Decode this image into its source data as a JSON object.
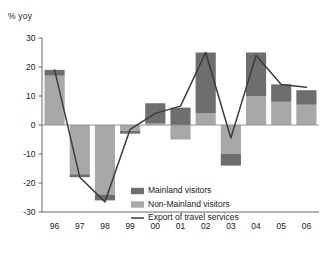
{
  "chart_data": {
    "type": "bar",
    "subtype": "stacked-bar-with-line-overlay",
    "title": "",
    "unit_label": "% yoy",
    "xlabel": "",
    "ylabel": "",
    "ylim": [
      -30,
      30
    ],
    "yticks": [
      30,
      20,
      10,
      0,
      -10,
      -20,
      -30
    ],
    "ytick_labels": [
      "30",
      "20",
      "10",
      "0",
      "-10",
      "-20",
      "-30"
    ],
    "grid": false,
    "legend_position": "inside-right-lower",
    "categories": [
      "96",
      "97",
      "98",
      "99",
      "00",
      "01",
      "02",
      "03",
      "04",
      "05",
      "06"
    ],
    "series": [
      {
        "name": "Mainland visitors",
        "type": "bar",
        "stack": "contrib",
        "color": "#6e6e6e",
        "values": [
          2,
          -1,
          -2,
          -1,
          7,
          6,
          21,
          -4,
          15,
          6,
          5
        ]
      },
      {
        "name": "Non-Mainland visitors",
        "type": "bar",
        "stack": "contrib",
        "color": "#a8a8a8",
        "values": [
          17,
          -17,
          -24,
          -2,
          0.5,
          -5,
          4,
          -10,
          10,
          8,
          7
        ]
      },
      {
        "name": "Export of travel services",
        "type": "line",
        "color": "#3c3c3c",
        "values": [
          19,
          -18,
          -26.5,
          -1.5,
          4,
          6.5,
          25,
          -4.5,
          24,
          14,
          13
        ]
      }
    ]
  },
  "legend": {
    "items": [
      {
        "label": "Mainland visitors",
        "marker": "swatch",
        "color": "#6e6e6e"
      },
      {
        "label": "Non-Mainland visitors",
        "marker": "swatch",
        "color": "#a8a8a8"
      },
      {
        "label": "Export of travel services",
        "marker": "line",
        "color": "#3c3c3c"
      }
    ]
  },
  "axis": {
    "unit": "% yoy"
  }
}
